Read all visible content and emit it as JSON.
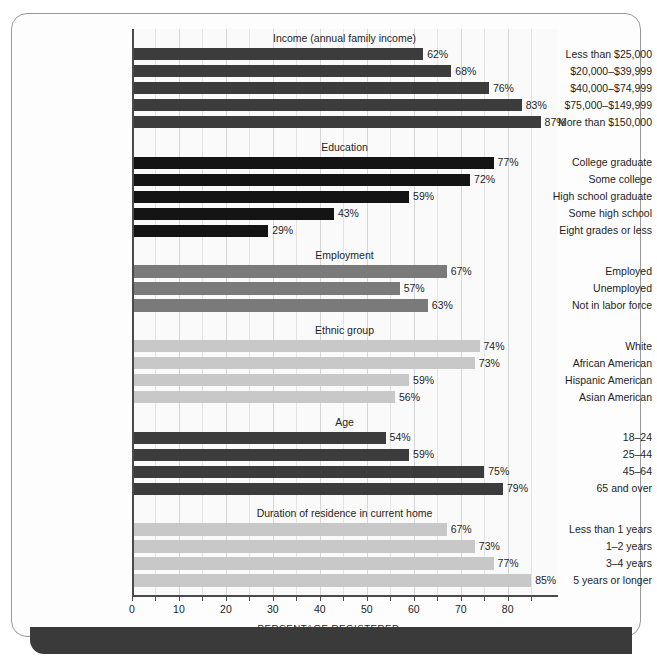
{
  "chart_data": {
    "type": "bar",
    "title": "",
    "xlabel": "PERCENTAGE REGISTERED",
    "ylabel": "",
    "xlim": [
      0,
      90.5
    ],
    "grid": true,
    "orientation": "horizontal",
    "axis": {
      "major_ticks": [
        0,
        10,
        20,
        30,
        40,
        50,
        60,
        70,
        80
      ],
      "major_tick_labels": [
        "0",
        "10",
        "20",
        "30",
        "40",
        "50",
        "60",
        "70",
        "80"
      ],
      "minor_ticks": [
        5,
        15,
        25,
        35,
        45,
        55,
        65,
        75,
        85
      ],
      "tick_step": 10,
      "minor_step": 5
    },
    "value_suffix": "%",
    "groups": [
      {
        "name": "Income (annual family income)",
        "color": "#3c3c3c",
        "categories": [
          "Less than $25,000",
          "$20,000–$39,999",
          "$40,000–$74,999",
          "$75,000–$149,999",
          "More than $150,000"
        ],
        "values": [
          62,
          68,
          76,
          83,
          87
        ],
        "labels": [
          "62%",
          "68%",
          "76%",
          "83%",
          "87%"
        ]
      },
      {
        "name": "Education",
        "color": "#141414",
        "categories": [
          "College graduate",
          "Some college",
          "High school graduate",
          "Some high school",
          "Eight grades or less"
        ],
        "values": [
          77,
          72,
          59,
          43,
          29
        ],
        "labels": [
          "77%",
          "72%",
          "59%",
          "43%",
          "29%"
        ]
      },
      {
        "name": "Employment",
        "color": "#7a7a7a",
        "categories": [
          "Employed",
          "Unemployed",
          "Not in labor force"
        ],
        "values": [
          67,
          57,
          63
        ],
        "labels": [
          "67%",
          "57%",
          "63%"
        ]
      },
      {
        "name": "Ethnic group",
        "color": "#c8c8c8",
        "categories": [
          "White",
          "African American",
          "Hispanic American",
          "Asian American"
        ],
        "values": [
          74,
          73,
          59,
          56
        ],
        "labels": [
          "74%",
          "73%",
          "59%",
          "56%"
        ]
      },
      {
        "name": "Age",
        "color": "#3c3c3c",
        "categories": [
          "18–24",
          "25–44",
          "45–64",
          "65 and over"
        ],
        "values": [
          54,
          59,
          75,
          79
        ],
        "labels": [
          "54%",
          "59%",
          "75%",
          "79%"
        ]
      },
      {
        "name": "Duration of residence in current home",
        "color": "#c8c8c8",
        "categories": [
          "Less than 1 years",
          "1–2 years",
          "3–4 years",
          "5 years or longer"
        ],
        "values": [
          67,
          73,
          77,
          85
        ],
        "labels": [
          "67%",
          "73%",
          "77%",
          "85%"
        ]
      }
    ]
  },
  "footer": {
    "band_color": "#3a3a3a"
  }
}
